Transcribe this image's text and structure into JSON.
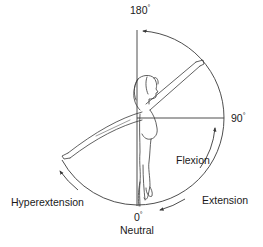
{
  "diagram": {
    "labels": {
      "top": "180",
      "right": "90",
      "bottom_angle": "0",
      "bottom_name": "Neutral",
      "flexion": "Flexion",
      "extension": "Extension",
      "hyperextension": "Hyperextension",
      "degree_symbol": "°"
    },
    "geometry": {
      "center": [
        137,
        118
      ],
      "radius": 87,
      "raised_hand": [
        203,
        63
      ],
      "extended_hand": [
        62,
        157
      ]
    },
    "colors": {
      "line": "#3a3a3a",
      "text": "#1a1a1a",
      "background": "#ffffff"
    }
  }
}
